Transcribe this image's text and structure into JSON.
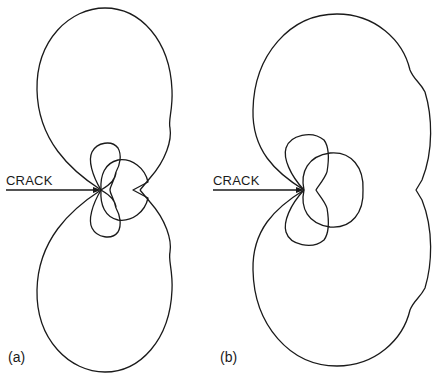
{
  "figure": {
    "panels": [
      {
        "id": "a",
        "label": "(a)",
        "crack_label": "CRACK"
      },
      {
        "id": "b",
        "label": "(b)",
        "crack_label": "CRACK"
      }
    ]
  },
  "colors": {
    "line": "#1a1a1a",
    "background": "#ffffff"
  }
}
